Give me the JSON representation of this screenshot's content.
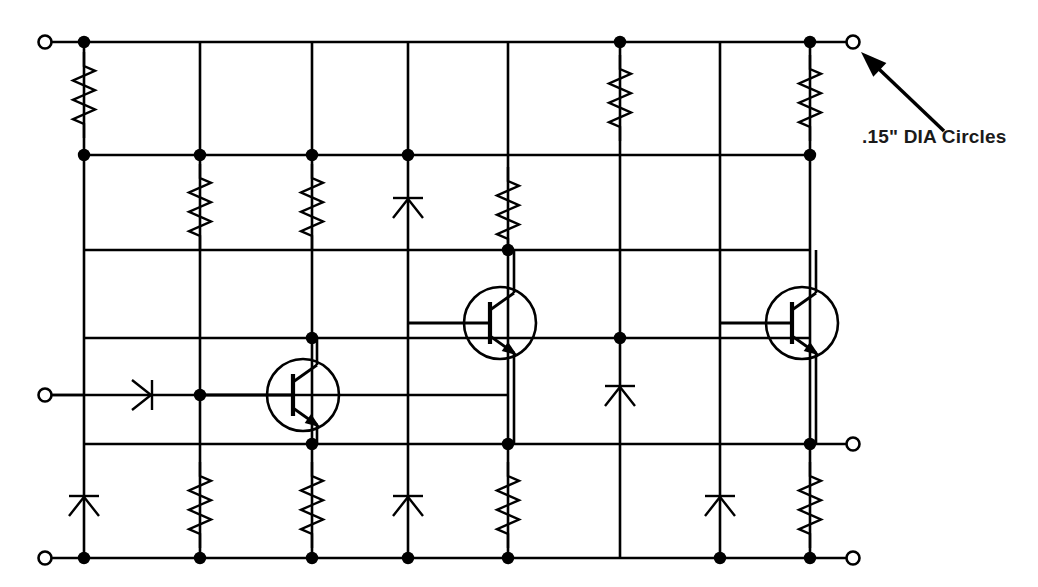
{
  "drawing": {
    "title": "Transistor ladder schematic",
    "background_color": "#ffffff",
    "ink_color": "#000000",
    "width": 1038,
    "height": 587
  },
  "annotation": {
    "label": ".15\" DIA Circles",
    "text_x": 862,
    "text_y": 143,
    "arrow_from_x": 944,
    "arrow_from_y": 131,
    "arrow_to_x": 861,
    "arrow_to_y": 52,
    "points_to": "top-right-terminal-circle"
  },
  "grid": {
    "columns_x": [
      84,
      200,
      312,
      408,
      508,
      620,
      720,
      810
    ],
    "rows_y": [
      42,
      155,
      250,
      338,
      395,
      444,
      558
    ],
    "row_names": [
      "rail-top",
      "row-2",
      "row-3",
      "row-4-transistor",
      "row-input",
      "row-5",
      "rail-bottom"
    ]
  },
  "terminals": [
    {
      "name": "input-top-left",
      "x": 45,
      "y": 42,
      "r": 6.5,
      "lead_to_x": 84
    },
    {
      "name": "output-top-right",
      "x": 853,
      "y": 42,
      "r": 6.5,
      "lead_to_x": 810
    },
    {
      "name": "input-mid-left",
      "x": 45,
      "y": 395,
      "r": 6.5,
      "lead_to_x": 84
    },
    {
      "name": "output-mid-right",
      "x": 853,
      "y": 444,
      "r": 6.5,
      "lead_to_x": 810
    },
    {
      "name": "input-bottom-left",
      "x": 45,
      "y": 558,
      "r": 6.5,
      "lead_to_x": 84
    },
    {
      "name": "output-bottom-right",
      "x": 853,
      "y": 558,
      "r": 6.5,
      "lead_to_x": 810
    }
  ],
  "horizontal_rails": [
    {
      "name": "rail-top",
      "y": 42,
      "x1": 84,
      "x2": 810
    },
    {
      "name": "rail-row-2",
      "y": 155,
      "x1": 84,
      "x2": 810
    },
    {
      "name": "rail-row-3",
      "y": 250,
      "x1": 84,
      "x2": 810
    },
    {
      "name": "rail-row-4",
      "y": 338,
      "x1": 84,
      "x2": 810
    },
    {
      "name": "rail-row-input",
      "y": 395,
      "x1": 45,
      "x2": 508
    },
    {
      "name": "rail-row-5",
      "y": 444,
      "x1": 84,
      "x2": 810
    },
    {
      "name": "rail-bottom",
      "y": 558,
      "x1": 84,
      "x2": 810
    }
  ],
  "vertical_runs": [
    {
      "name": "column-1",
      "x": 84,
      "y1": 42,
      "y2": 558
    },
    {
      "name": "column-2",
      "x": 200,
      "y1": 42,
      "y2": 558
    },
    {
      "name": "column-3",
      "x": 312,
      "y1": 42,
      "y2": 558
    },
    {
      "name": "column-4",
      "x": 408,
      "y1": 42,
      "y2": 558
    },
    {
      "name": "column-5",
      "x": 508,
      "y1": 42,
      "y2": 558
    },
    {
      "name": "column-6",
      "x": 620,
      "y1": 42,
      "y2": 558
    },
    {
      "name": "column-7",
      "x": 720,
      "y1": 42,
      "y2": 558
    },
    {
      "name": "column-8",
      "x": 810,
      "y1": 42,
      "y2": 558
    }
  ],
  "junction_dots": [
    {
      "name": "dot-c1-top",
      "x": 84,
      "y": 42
    },
    {
      "name": "dot-c6-top",
      "x": 620,
      "y": 42
    },
    {
      "name": "dot-c8-top",
      "x": 810,
      "y": 42
    },
    {
      "name": "dot-c1-row2",
      "x": 84,
      "y": 155
    },
    {
      "name": "dot-c2-row2",
      "x": 200,
      "y": 155
    },
    {
      "name": "dot-c3-row2",
      "x": 312,
      "y": 155
    },
    {
      "name": "dot-c4-row2",
      "x": 408,
      "y": 155
    },
    {
      "name": "dot-c8-row2",
      "x": 810,
      "y": 155
    },
    {
      "name": "dot-c5-row3",
      "x": 508,
      "y": 250
    },
    {
      "name": "dot-c3-row4",
      "x": 312,
      "y": 338
    },
    {
      "name": "dot-c6-row4",
      "x": 620,
      "y": 338
    },
    {
      "name": "dot-c2-rowinput",
      "x": 200,
      "y": 395
    },
    {
      "name": "dot-c3-row5",
      "x": 312,
      "y": 444
    },
    {
      "name": "dot-c5-row5",
      "x": 508,
      "y": 444
    },
    {
      "name": "dot-c8-row5",
      "x": 810,
      "y": 444
    },
    {
      "name": "dot-c1-bottom",
      "x": 84,
      "y": 558
    },
    {
      "name": "dot-c2-bottom",
      "x": 200,
      "y": 558
    },
    {
      "name": "dot-c3-bottom",
      "x": 312,
      "y": 558
    },
    {
      "name": "dot-c4-bottom",
      "x": 408,
      "y": 558
    },
    {
      "name": "dot-c5-bottom",
      "x": 508,
      "y": 558
    },
    {
      "name": "dot-c7-bottom",
      "x": 720,
      "y": 558
    },
    {
      "name": "dot-c8-bottom",
      "x": 810,
      "y": 558
    }
  ],
  "resistors": [
    {
      "name": "resistor-c1-top",
      "x": 84,
      "y_center": 95,
      "orientation": "vertical"
    },
    {
      "name": "resistor-c6-top",
      "x": 620,
      "y_center": 98,
      "orientation": "vertical"
    },
    {
      "name": "resistor-c8-top",
      "x": 810,
      "y_center": 98,
      "orientation": "vertical"
    },
    {
      "name": "resistor-c2-row2",
      "x": 200,
      "y_center": 207,
      "orientation": "vertical"
    },
    {
      "name": "resistor-c3-row2",
      "x": 312,
      "y_center": 207,
      "orientation": "vertical"
    },
    {
      "name": "resistor-c5-row2",
      "x": 508,
      "y_center": 210,
      "orientation": "vertical"
    },
    {
      "name": "resistor-c2-bottom",
      "x": 200,
      "y_center": 505,
      "orientation": "vertical"
    },
    {
      "name": "resistor-c3-bottom",
      "x": 312,
      "y_center": 505,
      "orientation": "vertical"
    },
    {
      "name": "resistor-c5-bottom",
      "x": 508,
      "y_center": 505,
      "orientation": "vertical"
    },
    {
      "name": "resistor-c8-bottom",
      "x": 810,
      "y_center": 505,
      "orientation": "vertical"
    }
  ],
  "diodes": [
    {
      "name": "diode-c4-row2",
      "x": 408,
      "y_center": 207,
      "orientation": "vertical-up"
    },
    {
      "name": "diode-c6-row4",
      "x": 620,
      "y_center": 395,
      "orientation": "vertical-up"
    },
    {
      "name": "diode-c1-bottom",
      "x": 84,
      "y_center": 505,
      "orientation": "vertical-up"
    },
    {
      "name": "diode-c4-bottom",
      "x": 408,
      "y_center": 505,
      "orientation": "vertical-up"
    },
    {
      "name": "diode-c7-bottom",
      "x": 720,
      "y_center": 505,
      "orientation": "vertical-up"
    },
    {
      "name": "diode-input-series",
      "x_center": 143,
      "y": 395,
      "orientation": "horizontal-right"
    }
  ],
  "transistors": [
    {
      "name": "transistor-q1",
      "type": "npn",
      "cx": 303,
      "cy": 395,
      "r": 36,
      "base_from_x": 200,
      "collector_to_y": 338,
      "emitter_to_y": 444
    },
    {
      "name": "transistor-q2",
      "type": "npn",
      "cx": 500,
      "cy": 323,
      "r": 36,
      "base_from_x": 408,
      "collector_to_y": 250,
      "emitter_to_y": 444
    },
    {
      "name": "transistor-q3",
      "type": "npn",
      "cx": 802,
      "cy": 323,
      "r": 36,
      "base_from_x": 720,
      "collector_to_y": 250,
      "emitter_to_y": 444
    }
  ]
}
